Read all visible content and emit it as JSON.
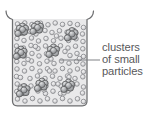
{
  "diagram": {
    "type": "particle-diagram",
    "background_color": "#ffffff"
  },
  "container": {
    "name": "beaker",
    "outline_color": "#6d6e70",
    "fill_color": "#e8e8e8",
    "rim_style": "flared-lip",
    "geometry": {
      "left": 12.5,
      "right": 87.0,
      "top": 19.0,
      "bottom": 106.0,
      "corner_radius": 4.5,
      "rim_top": 11.0,
      "lip_left_outer": 5.5,
      "lip_right_outer": 94.0
    }
  },
  "annotation": {
    "lines": [
      "clusters",
      "of small",
      "particles"
    ],
    "text_color": "#58585a",
    "leader": {
      "color": "#808285",
      "x1": 60.0,
      "y1": 60.0,
      "x2": 100.0,
      "y2": 60.0
    },
    "text_x": 102,
    "line_y": [
      51,
      63,
      75
    ]
  },
  "particles": {
    "single": {
      "label": "small particle",
      "radius": 2.3,
      "fill_color": "#d4d4d6",
      "stroke_color": "#808285",
      "highlight_color": "#f2f2f3",
      "count": 118
    },
    "cluster": {
      "label": "cluster of small particles",
      "member_radius": 3.1,
      "fill_color": "#a7a9ac",
      "stroke_color": "#58595b",
      "highlight_color": "#d9dadb",
      "count": 8
    },
    "single_positions": [
      [
        17.5,
        24.0
      ],
      [
        24.8,
        23.0
      ],
      [
        32.0,
        24.5
      ],
      [
        40.5,
        23.2
      ],
      [
        48.0,
        24.8
      ],
      [
        55.2,
        23.0
      ],
      [
        62.5,
        24.4
      ],
      [
        70.0,
        23.4
      ],
      [
        77.5,
        24.6
      ],
      [
        83.5,
        27.5
      ],
      [
        16.8,
        31.0
      ],
      [
        23.0,
        33.5
      ],
      [
        30.0,
        31.5
      ],
      [
        45.0,
        30.5
      ],
      [
        52.0,
        32.5
      ],
      [
        59.5,
        30.8
      ],
      [
        67.0,
        32.2
      ],
      [
        74.0,
        30.5
      ],
      [
        82.5,
        34.0
      ],
      [
        17.0,
        38.5
      ],
      [
        24.0,
        40.5
      ],
      [
        31.5,
        38.0
      ],
      [
        38.5,
        41.0
      ],
      [
        46.0,
        38.5
      ],
      [
        53.5,
        40.8
      ],
      [
        61.0,
        38.2
      ],
      [
        68.5,
        40.5
      ],
      [
        76.0,
        38.8
      ],
      [
        83.0,
        41.5
      ],
      [
        16.5,
        46.0
      ],
      [
        23.5,
        48.0
      ],
      [
        31.0,
        45.5
      ],
      [
        38.0,
        48.5
      ],
      [
        45.5,
        46.0
      ],
      [
        52.5,
        48.2
      ],
      [
        60.5,
        45.8
      ],
      [
        68.0,
        48.0
      ],
      [
        75.5,
        46.2
      ],
      [
        82.8,
        48.8
      ],
      [
        17.2,
        54.0
      ],
      [
        24.5,
        55.8
      ],
      [
        32.0,
        53.5
      ],
      [
        39.0,
        56.0
      ],
      [
        46.5,
        53.8
      ],
      [
        70.0,
        55.5
      ],
      [
        77.0,
        53.5
      ],
      [
        83.5,
        56.5
      ],
      [
        16.8,
        61.5
      ],
      [
        24.0,
        63.5
      ],
      [
        31.5,
        61.0
      ],
      [
        39.5,
        63.8
      ],
      [
        47.0,
        61.2
      ],
      [
        54.0,
        63.5
      ],
      [
        61.5,
        61.0
      ],
      [
        69.0,
        63.2
      ],
      [
        76.5,
        61.5
      ],
      [
        83.0,
        64.0
      ],
      [
        17.0,
        69.0
      ],
      [
        24.5,
        71.0
      ],
      [
        32.0,
        68.5
      ],
      [
        40.0,
        71.2
      ],
      [
        47.5,
        68.8
      ],
      [
        55.0,
        71.0
      ],
      [
        62.5,
        68.5
      ],
      [
        70.0,
        71.0
      ],
      [
        77.5,
        69.0
      ],
      [
        83.5,
        71.8
      ],
      [
        16.5,
        76.5
      ],
      [
        30.0,
        78.5
      ],
      [
        37.5,
        76.0
      ],
      [
        45.0,
        78.5
      ],
      [
        52.5,
        76.2
      ],
      [
        60.0,
        78.5
      ],
      [
        67.5,
        76.0
      ],
      [
        75.0,
        78.5
      ],
      [
        82.8,
        76.8
      ],
      [
        17.2,
        84.0
      ],
      [
        31.0,
        86.0
      ],
      [
        38.5,
        83.5
      ],
      [
        46.0,
        86.0
      ],
      [
        53.5,
        83.8
      ],
      [
        61.0,
        86.0
      ],
      [
        77.0,
        84.0
      ],
      [
        83.5,
        87.0
      ],
      [
        16.8,
        91.5
      ],
      [
        24.0,
        93.5
      ],
      [
        38.0,
        91.0
      ],
      [
        45.5,
        93.5
      ],
      [
        53.0,
        91.2
      ],
      [
        60.5,
        93.5
      ],
      [
        68.0,
        91.0
      ],
      [
        82.5,
        93.0
      ],
      [
        17.5,
        99.0
      ],
      [
        25.0,
        101.0
      ],
      [
        32.5,
        98.5
      ],
      [
        40.0,
        101.0
      ],
      [
        47.5,
        98.8
      ],
      [
        55.0,
        101.0
      ],
      [
        62.5,
        98.5
      ],
      [
        70.0,
        101.0
      ],
      [
        77.5,
        98.8
      ],
      [
        83.5,
        101.5
      ],
      [
        36.0,
        34.0
      ],
      [
        69.0,
        77.0
      ],
      [
        44.0,
        90.0
      ],
      [
        28.0,
        59.5
      ],
      [
        51.0,
        59.0
      ],
      [
        65.0,
        51.5
      ],
      [
        72.5,
        86.0
      ],
      [
        21.0,
        86.5
      ],
      [
        56.5,
        36.0
      ],
      [
        79.5,
        58.5
      ],
      [
        35.5,
        46.5
      ],
      [
        58.0,
        84.0
      ],
      [
        20.5,
        77.5
      ],
      [
        64.0,
        93.0
      ],
      [
        49.5,
        71.0
      ]
    ],
    "cluster_centers": [
      [
        22.5,
        29.5
      ],
      [
        37.5,
        27.5
      ],
      [
        53.5,
        50.5
      ],
      [
        21.0,
        52.5
      ],
      [
        72.0,
        34.0
      ],
      [
        24.0,
        90.0
      ],
      [
        68.5,
        85.5
      ],
      [
        42.0,
        84.5
      ]
    ],
    "cluster_offsets": [
      [
        0,
        -3.4
      ],
      [
        -3.1,
        -1.2
      ],
      [
        3.1,
        -1.2
      ],
      [
        -2.0,
        2.6
      ],
      [
        2.0,
        2.6
      ],
      [
        0,
        0
      ],
      [
        -4.6,
        3.9
      ]
    ]
  }
}
